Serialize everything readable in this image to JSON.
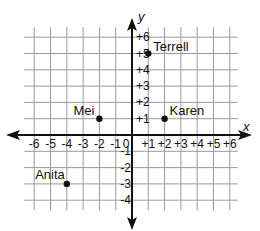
{
  "diagram": {
    "type": "coordinate-plane",
    "axes": {
      "x_label": "x",
      "y_label": "y",
      "x_ticks": [
        "-6",
        "-5",
        "-4",
        "-3",
        "-2",
        "-1",
        "0",
        "+1",
        "+2",
        "+3",
        "+4",
        "+5",
        "+6"
      ],
      "y_ticks_positive": [
        "+6",
        "+5",
        "+4",
        "+3",
        "+2",
        "+1"
      ],
      "y_ticks_negative": [
        "-1",
        "-2",
        "-3",
        "-4"
      ],
      "x_range": [
        -6,
        6
      ],
      "y_range": [
        -4,
        6
      ]
    },
    "points": [
      {
        "name": "Terrell",
        "x": 1,
        "y": 5
      },
      {
        "name": "Mei",
        "x": -2,
        "y": 1
      },
      {
        "name": "Karen",
        "x": 2,
        "y": 1
      },
      {
        "name": "Anita",
        "x": -4,
        "y": -3
      }
    ],
    "colors": {
      "grid": "#9a9a9a",
      "axis": "#111111",
      "point": "#111111"
    }
  }
}
